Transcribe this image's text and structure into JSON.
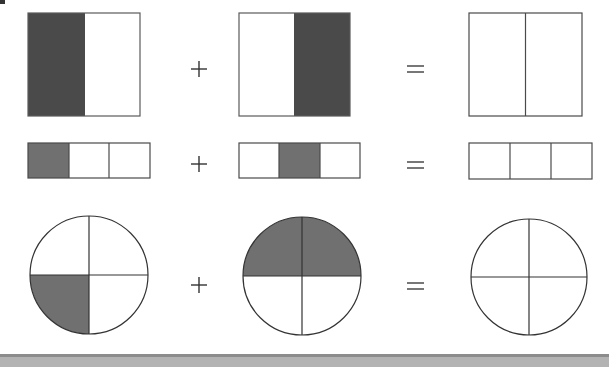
{
  "colors": {
    "stroke": "#3a3a3a",
    "dark_fill": "#4a4a4a",
    "gray_fill": "#707070",
    "empty_fill": "#ffffff",
    "band_top": "#8c8c8c",
    "band_fill": "#b3b3b3"
  },
  "operators": {
    "plus": "+",
    "equals": "="
  },
  "rows": [
    {
      "model": "rectangle-halves",
      "operands": [
        {
          "parts": 2,
          "shaded": [
            0
          ],
          "fraction": "1/2"
        },
        {
          "parts": 2,
          "shaded": [
            1
          ],
          "fraction": "1/2"
        }
      ],
      "result": {
        "parts": 2,
        "shaded": []
      }
    },
    {
      "model": "rectangle-thirds",
      "operands": [
        {
          "parts": 3,
          "shaded": [
            0
          ],
          "fraction": "1/3"
        },
        {
          "parts": 3,
          "shaded": [
            1
          ],
          "fraction": "1/3"
        }
      ],
      "result": {
        "parts": 3,
        "shaded": []
      }
    },
    {
      "model": "circle-quarters",
      "operands": [
        {
          "parts": 4,
          "shaded": [
            "bottom-left"
          ],
          "fraction": "1/4"
        },
        {
          "parts": 4,
          "shaded": [
            "top-left",
            "top-right"
          ],
          "fraction": "2/4"
        }
      ],
      "result": {
        "parts": 4,
        "shaded": []
      }
    }
  ]
}
